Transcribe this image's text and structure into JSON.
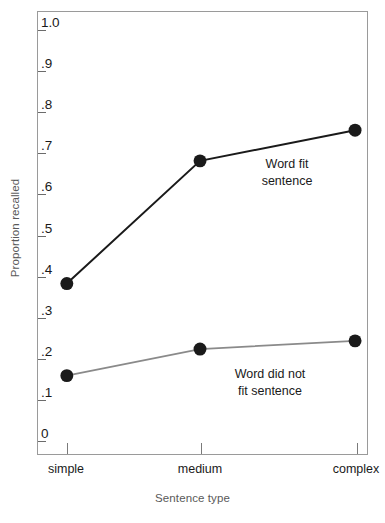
{
  "chart_data": {
    "type": "line",
    "title": "",
    "xlabel": "Sentence type",
    "ylabel": "Proportion recalled",
    "categories": [
      "simple",
      "medium",
      "complex"
    ],
    "ylim": [
      0,
      1.0
    ],
    "yticks": [
      0,
      0.1,
      0.2,
      0.3,
      0.4,
      0.5,
      0.6,
      0.7,
      0.8,
      0.9,
      1.0
    ],
    "ytick_labels": [
      "0",
      ".1",
      ".2",
      ".3",
      ".4",
      ".5",
      ".6",
      ".7",
      ".8",
      ".9",
      "1.0"
    ],
    "grid": false,
    "legend_position": "inline-annotation",
    "series": [
      {
        "name": "Word fit sentence",
        "values": [
          0.38,
          0.68,
          0.755
        ],
        "color": "#1a1a1a",
        "marker": "filled-circle",
        "annotation": "Word fit\nsentence"
      },
      {
        "name": "Word did not fit sentence",
        "values": [
          0.155,
          0.22,
          0.24
        ],
        "color": "#8a8a8a",
        "marker": "filled-circle",
        "annotation": "Word did not\nfit sentence"
      }
    ]
  },
  "axes": {
    "y_label": "Proportion recalled",
    "x_label": "Sentence type",
    "y_tick_labels": [
      "1.0",
      ".9",
      ".8",
      ".7",
      ".6",
      ".5",
      ".4",
      ".3",
      ".2",
      ".1",
      "0"
    ],
    "x_tick_labels": [
      "simple",
      "medium",
      "complex"
    ]
  },
  "annotations": {
    "upper_line_1": "Word fit",
    "upper_line_2": "sentence",
    "lower_line_1": "Word did not",
    "lower_line_2": "fit sentence"
  },
  "colors": {
    "upper_series": "#1a1a1a",
    "lower_series": "#8a8a8a",
    "axis_text": "#595959",
    "frame": "#9a9a9a"
  }
}
